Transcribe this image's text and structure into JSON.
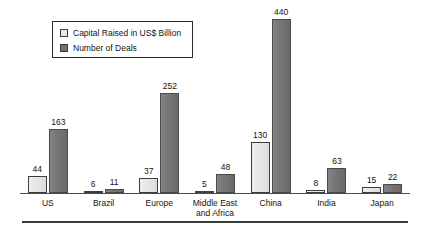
{
  "chart_data": {
    "type": "bar",
    "title": "",
    "subtitle": "",
    "xlabel": "",
    "ylabel": "",
    "grid": false,
    "legend_position": "top-left",
    "axis_visible": {
      "x": true,
      "y": false
    },
    "ylim": [
      0,
      440
    ],
    "categories": [
      "US",
      "Brazil",
      "Europe",
      "Middle East and Africa",
      "China",
      "India",
      "Japan"
    ],
    "series": [
      {
        "name": "Capital Raised in US$ Billion",
        "color": "#e9e9e9",
        "border_color": "#3f3f3f",
        "values": [
          44,
          6,
          37,
          5,
          130,
          8,
          15
        ]
      },
      {
        "name": "Number of Deals",
        "color": "#6f6f6f",
        "border_color": "#4a4a4a",
        "values": [
          163,
          11,
          252,
          48,
          440,
          63,
          22
        ]
      }
    ],
    "data_labels": [
      {
        "category": "US",
        "capital_raised": 44,
        "number_of_deals": 163
      },
      {
        "category": "Brazil",
        "capital_raised": 6,
        "number_of_deals": 11
      },
      {
        "category": "Europe",
        "capital_raised": 37,
        "number_of_deals": 252
      },
      {
        "category": "Middle East and Africa",
        "capital_raised": 5,
        "number_of_deals": 48
      },
      {
        "category": "China",
        "capital_raised": 130,
        "number_of_deals": 440
      },
      {
        "category": "India",
        "capital_raised": 8,
        "number_of_deals": 63
      },
      {
        "category": "Japan",
        "capital_raised": 15,
        "number_of_deals": 22
      }
    ]
  },
  "legend": {
    "items": [
      {
        "label": "Capital Raised in US$ Billion",
        "swatch": "light"
      },
      {
        "label": "Number of Deals",
        "swatch": "dark"
      }
    ]
  },
  "category_labels": [
    {
      "line1": "US",
      "line2": ""
    },
    {
      "line1": "Brazil",
      "line2": ""
    },
    {
      "line1": "Europe",
      "line2": ""
    },
    {
      "line1": "Middle East",
      "line2": "and Africa"
    },
    {
      "line1": "China",
      "line2": ""
    },
    {
      "line1": "India",
      "line2": ""
    },
    {
      "line1": "Japan",
      "line2": ""
    }
  ]
}
